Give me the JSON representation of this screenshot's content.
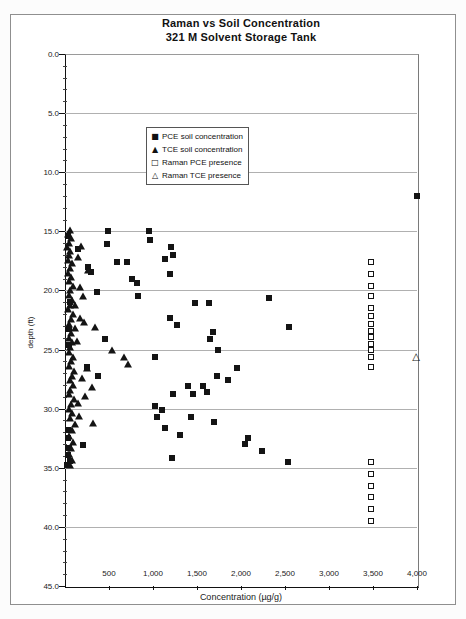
{
  "chart_data": {
    "type": "scatter",
    "title": "Raman vs Soil Concentration",
    "subtitle": "321 M Solvent Storage Tank",
    "xlabel": "Concentration (µg/g)",
    "ylabel": "depth (ft)",
    "xlim": [
      0,
      4000
    ],
    "ylim": [
      0,
      45
    ],
    "y_inverted": true,
    "grid": "horizontal-major",
    "x_tick_values": [
      500,
      1000,
      1500,
      2000,
      2500,
      3000,
      3500,
      4000
    ],
    "x_tick_labels": [
      "500",
      "1,000",
      "1,500",
      "2,000",
      "2,500",
      "3,000",
      "3,500",
      "4,000"
    ],
    "y_tick_values": [
      0,
      5,
      10,
      15,
      20,
      25,
      30,
      35,
      40,
      45
    ],
    "y_tick_labels": [
      "0.0",
      "5.0",
      "10.0",
      "15.0",
      "20.0",
      "25.0",
      "30.0",
      "35.0",
      "40.0",
      "45.0"
    ],
    "y_minor_tick_step": 1,
    "legend": {
      "position": "inside-upper-left",
      "entries": [
        {
          "glyph": "■",
          "label": "PCE soil concentration"
        },
        {
          "glyph": "▲",
          "label": "TCE soil concentration"
        },
        {
          "glyph": "□",
          "label": "Raman PCE presence"
        },
        {
          "glyph": "△",
          "label": "Raman TCE presence"
        }
      ]
    },
    "series": [
      {
        "name": "PCE soil concentration",
        "marker": "filled-square",
        "points": [
          [
            4000,
            12.0
          ],
          [
            490,
            15.0
          ],
          [
            950,
            15.0
          ],
          [
            30,
            15.4
          ],
          [
            965,
            15.7
          ],
          [
            475,
            16.1
          ],
          [
            1210,
            16.3
          ],
          [
            150,
            16.5
          ],
          [
            1230,
            17.0
          ],
          [
            1135,
            17.3
          ],
          [
            590,
            17.6
          ],
          [
            700,
            17.6
          ],
          [
            265,
            18.0
          ],
          [
            300,
            18.4
          ],
          [
            1190,
            18.6
          ],
          [
            760,
            19.0
          ],
          [
            815,
            19.4
          ],
          [
            360,
            20.1
          ],
          [
            835,
            20.5
          ],
          [
            2320,
            20.6
          ],
          [
            60,
            21.0
          ],
          [
            1475,
            21.1
          ],
          [
            1640,
            21.1
          ],
          [
            1190,
            22.3
          ],
          [
            1270,
            22.9
          ],
          [
            2540,
            23.1
          ],
          [
            40,
            23.3
          ],
          [
            1685,
            23.5
          ],
          [
            455,
            24.1
          ],
          [
            1650,
            24.1
          ],
          [
            50,
            24.6
          ],
          [
            1740,
            25.0
          ],
          [
            1025,
            25.6
          ],
          [
            245,
            26.5
          ],
          [
            1950,
            26.6
          ],
          [
            380,
            27.2
          ],
          [
            1725,
            27.2
          ],
          [
            1855,
            27.6
          ],
          [
            1400,
            28.1
          ],
          [
            1570,
            28.1
          ],
          [
            1610,
            28.6
          ],
          [
            1230,
            28.8
          ],
          [
            1460,
            28.8
          ],
          [
            1025,
            29.8
          ],
          [
            1100,
            30.1
          ],
          [
            1040,
            30.7
          ],
          [
            1430,
            30.7
          ],
          [
            1695,
            31.1
          ],
          [
            1135,
            31.6
          ],
          [
            30,
            31.8
          ],
          [
            1305,
            32.2
          ],
          [
            35,
            32.5
          ],
          [
            2075,
            32.5
          ],
          [
            2040,
            33.0
          ],
          [
            210,
            33.1
          ],
          [
            45,
            33.3
          ],
          [
            2240,
            33.6
          ],
          [
            30,
            33.9
          ],
          [
            1215,
            34.2
          ],
          [
            55,
            34.4
          ],
          [
            2530,
            34.5
          ],
          [
            25,
            34.8
          ]
        ]
      },
      {
        "name": "TCE soil concentration",
        "marker": "filled-triangle",
        "points": [
          [
            55,
            14.9
          ],
          [
            30,
            15.2
          ],
          [
            70,
            15.6
          ],
          [
            40,
            16.0
          ],
          [
            185,
            16.2
          ],
          [
            25,
            16.3
          ],
          [
            60,
            16.7
          ],
          [
            45,
            17.0
          ],
          [
            150,
            17.2
          ],
          [
            30,
            17.4
          ],
          [
            80,
            17.7
          ],
          [
            55,
            18.1
          ],
          [
            260,
            18.3
          ],
          [
            35,
            18.5
          ],
          [
            70,
            18.9
          ],
          [
            45,
            19.2
          ],
          [
            95,
            19.6
          ],
          [
            170,
            19.7
          ],
          [
            60,
            20.0
          ],
          [
            40,
            20.4
          ],
          [
            210,
            20.5
          ],
          [
            75,
            20.8
          ],
          [
            55,
            21.2
          ],
          [
            115,
            21.2
          ],
          [
            35,
            21.6
          ],
          [
            90,
            22.0
          ],
          [
            170,
            22.3
          ],
          [
            65,
            22.4
          ],
          [
            220,
            22.7
          ],
          [
            45,
            22.8
          ],
          [
            340,
            23.1
          ],
          [
            110,
            23.2
          ],
          [
            70,
            23.6
          ],
          [
            50,
            24.0
          ],
          [
            135,
            24.3
          ],
          [
            85,
            24.4
          ],
          [
            60,
            24.8
          ],
          [
            530,
            25.0
          ],
          [
            40,
            25.2
          ],
          [
            95,
            25.6
          ],
          [
            665,
            25.6
          ],
          [
            65,
            26.0
          ],
          [
            720,
            26.2
          ],
          [
            45,
            26.4
          ],
          [
            250,
            26.6
          ],
          [
            105,
            26.8
          ],
          [
            75,
            27.2
          ],
          [
            190,
            27.4
          ],
          [
            55,
            27.6
          ],
          [
            90,
            28.0
          ],
          [
            310,
            28.2
          ],
          [
            60,
            28.4
          ],
          [
            40,
            28.8
          ],
          [
            230,
            28.9
          ],
          [
            100,
            29.2
          ],
          [
            145,
            29.5
          ],
          [
            70,
            29.6
          ],
          [
            50,
            30.0
          ],
          [
            85,
            30.4
          ],
          [
            160,
            30.6
          ],
          [
            60,
            30.8
          ],
          [
            320,
            31.2
          ],
          [
            110,
            31.3
          ],
          [
            75,
            31.8
          ],
          [
            50,
            32.3
          ],
          [
            90,
            32.8
          ],
          [
            65,
            33.3
          ],
          [
            45,
            33.8
          ],
          [
            80,
            34.3
          ],
          [
            55,
            34.8
          ]
        ]
      },
      {
        "name": "Raman PCE presence",
        "marker": "open-square",
        "points": [
          [
            3475,
            17.6
          ],
          [
            3475,
            18.6
          ],
          [
            3475,
            19.6
          ],
          [
            3475,
            20.5
          ],
          [
            3475,
            21.5
          ],
          [
            3475,
            22.2
          ],
          [
            3475,
            22.8
          ],
          [
            3475,
            23.4
          ],
          [
            3475,
            23.9
          ],
          [
            3475,
            24.5
          ],
          [
            3475,
            25.0
          ],
          [
            3475,
            25.6
          ],
          [
            3475,
            26.5
          ],
          [
            3475,
            34.5
          ],
          [
            3475,
            35.5
          ],
          [
            3475,
            36.5
          ],
          [
            3475,
            37.5
          ],
          [
            3475,
            38.5
          ],
          [
            3475,
            39.5
          ]
        ]
      },
      {
        "name": "Raman TCE presence",
        "marker": "open-triangle",
        "points": [
          [
            3990,
            25.6
          ]
        ]
      }
    ]
  }
}
